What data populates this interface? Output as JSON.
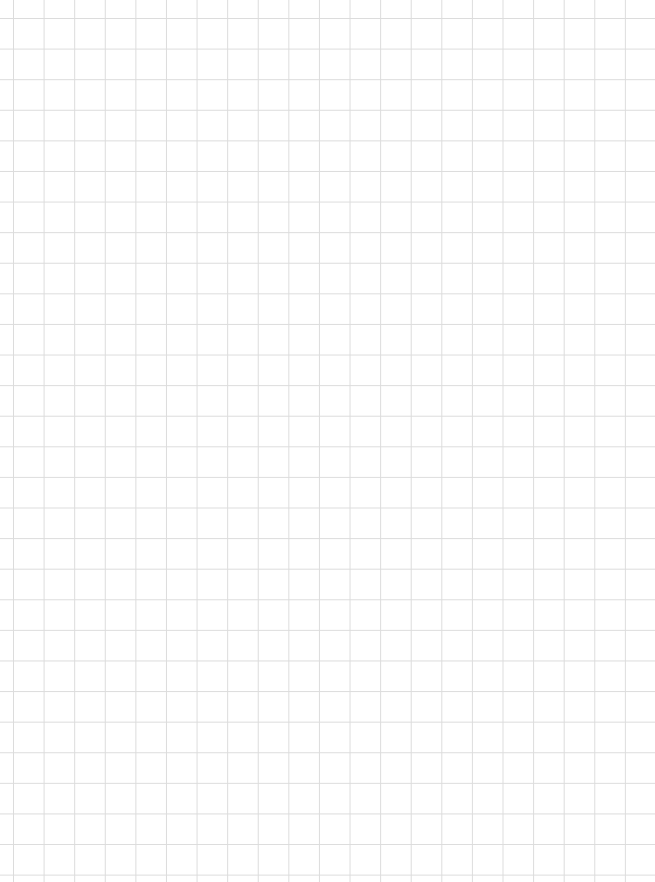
{
  "page": {
    "type": "graph-paper",
    "background_color": "#ffffff",
    "grid_color": "#dcdcdc",
    "grid_spacing_px": 30.6,
    "text": []
  }
}
